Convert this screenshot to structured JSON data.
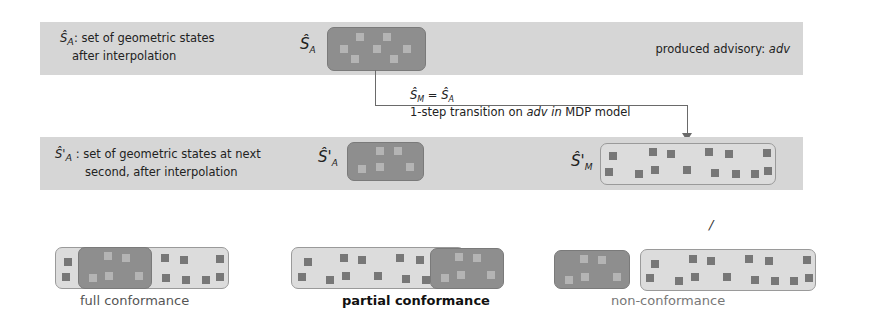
{
  "top_band": {
    "label_line1": "Ŝ",
    "label_sub": "A",
    "label_rest1": ": set of geometric states",
    "label_line2": "after interpolation",
    "symbol": "Ŝ",
    "symbol_sub": "A",
    "right_label_prefix": "produced advisory: ",
    "right_label_var": "adv"
  },
  "transition": {
    "equation_lhs": "Ŝ",
    "equation_lhs_sub": "M",
    "equation_op": " = ",
    "equation_rhs": "Ŝ",
    "equation_rhs_sub": "A",
    "text_prefix": "1-step transition on ",
    "text_var": "adv in",
    "text_suffix": " MDP model"
  },
  "mid_band": {
    "label_sym": "Ŝ'",
    "label_sub": "A",
    "label_rest1": " : set of geometric states at next",
    "label_line2": "second, after interpolation",
    "symbol_a": "Ŝ'",
    "symbol_a_sub": "A",
    "symbol_m": "Ŝ'",
    "symbol_m_sub": "M"
  },
  "stray_mark": "/",
  "outcomes": [
    {
      "label": "full conformance",
      "emphasis": false
    },
    {
      "label": "partial conformance",
      "emphasis": true
    },
    {
      "label": "non-conformance",
      "emphasis": false
    }
  ],
  "colors": {
    "band": "#d6d6d6",
    "set_dark": "#8e8e8e",
    "set_light": "#dcdcdc",
    "state_dark": "#777777",
    "state_light": "#b4b4b4",
    "connector": "#6a6a6a"
  }
}
